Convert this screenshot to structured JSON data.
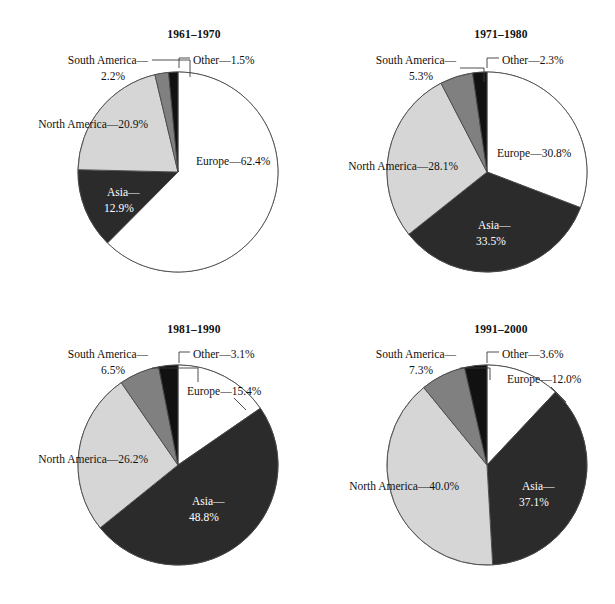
{
  "figure": {
    "background": "#ffffff",
    "width": 615,
    "height": 604
  },
  "palette": {
    "europe": "#ffffff",
    "asia": "#2b2b2b",
    "north_america": "#d6d6d6",
    "south_america": "#808080",
    "other": "#111111",
    "outline": "#4a4a4a",
    "text": "#111111",
    "text_on_dark": "#ffffff"
  },
  "chart_data": [
    {
      "type": "pie",
      "title": "1961–1970",
      "categories": [
        "Europe",
        "Asia",
        "North America",
        "South America",
        "Other"
      ],
      "values": [
        62.4,
        12.9,
        20.9,
        2.2,
        1.5
      ],
      "labels": [
        "Europe—62.4%",
        "Asia—",
        "12.9%",
        "North America—20.9%",
        "South America—",
        "2.2%",
        "Other—1.5%"
      ],
      "units": "percent",
      "start_angle_deg": 0,
      "direction": "clockwise"
    },
    {
      "type": "pie",
      "title": "1971–1980",
      "categories": [
        "Europe",
        "Asia",
        "North America",
        "South America",
        "Other"
      ],
      "values": [
        30.8,
        33.5,
        28.1,
        5.3,
        2.3
      ],
      "labels": [
        "Europe—30.8%",
        "Asia—",
        "33.5%",
        "North America—28.1%",
        "South America—",
        "5.3%",
        "Other—2.3%"
      ],
      "units": "percent",
      "start_angle_deg": 0,
      "direction": "clockwise"
    },
    {
      "type": "pie",
      "title": "1981–1990",
      "categories": [
        "Europe",
        "Asia",
        "North America",
        "South America",
        "Other"
      ],
      "values": [
        15.4,
        48.8,
        26.2,
        6.5,
        3.1
      ],
      "labels": [
        "Europe—15.4%",
        "Asia—",
        "48.8%",
        "North America—26.2%",
        "South America—",
        "6.5%",
        "Other—3.1%"
      ],
      "units": "percent",
      "start_angle_deg": 0,
      "direction": "clockwise"
    },
    {
      "type": "pie",
      "title": "1991–2000",
      "categories": [
        "Europe",
        "Asia",
        "North America",
        "South America",
        "Other"
      ],
      "values": [
        12.0,
        37.1,
        40.0,
        7.3,
        3.6
      ],
      "labels": [
        "Europe—12.0%",
        "Asia—",
        "37.1%",
        "North America—40.0%",
        "South America—",
        "7.3%",
        "Other—3.6%"
      ],
      "units": "percent",
      "start_angle_deg": 0,
      "direction": "clockwise"
    }
  ],
  "panels": [
    {
      "id": "p1",
      "title": "1961–1970",
      "cx": 178,
      "cy": 172,
      "r": 100,
      "title_x": 194,
      "title_y": 38,
      "texts": [
        {
          "name": "europe-label",
          "text": "Europe—62.4%",
          "x": 196,
          "y": 165,
          "anchor": "start",
          "dark": false
        },
        {
          "name": "asia-label-line1",
          "text": "Asia—",
          "x": 107,
          "y": 196,
          "anchor": "start",
          "dark": true
        },
        {
          "name": "asia-label-line2",
          "text": "12.9%",
          "x": 104,
          "y": 212,
          "anchor": "start",
          "dark": true
        },
        {
          "name": "north-america-label",
          "text": "North America—20.9%",
          "x": 148,
          "y": 128,
          "anchor": "end",
          "dark": false
        },
        {
          "name": "south-america-label-line1",
          "text": "South America—",
          "x": 148,
          "y": 64,
          "anchor": "end",
          "dark": false
        },
        {
          "name": "south-america-label-line2",
          "text": "2.2%",
          "x": 113,
          "y": 80,
          "anchor": "middle",
          "dark": false
        },
        {
          "name": "other-label",
          "text": "Other—1.5%",
          "x": 193,
          "y": 64,
          "anchor": "start",
          "dark": false
        }
      ]
    },
    {
      "id": "p2",
      "title": "1971–1980",
      "cx": 487,
      "cy": 172,
      "r": 100,
      "title_x": 501,
      "title_y": 38,
      "texts": [
        {
          "name": "europe-label",
          "text": "Europe—30.8%",
          "x": 497,
          "y": 157,
          "anchor": "start",
          "dark": false
        },
        {
          "name": "asia-label-line1",
          "text": "Asia—",
          "x": 478,
          "y": 229,
          "anchor": "start",
          "dark": true
        },
        {
          "name": "asia-label-line2",
          "text": "33.5%",
          "x": 476,
          "y": 245,
          "anchor": "start",
          "dark": true
        },
        {
          "name": "north-america-label",
          "text": "North America—28.1%",
          "x": 458,
          "y": 170,
          "anchor": "end",
          "dark": false
        },
        {
          "name": "south-america-label-line1",
          "text": "South America—",
          "x": 456,
          "y": 64,
          "anchor": "end",
          "dark": false
        },
        {
          "name": "south-america-label-line2",
          "text": "5.3%",
          "x": 421,
          "y": 80,
          "anchor": "middle",
          "dark": false
        },
        {
          "name": "other-label",
          "text": "Other—2.3%",
          "x": 502,
          "y": 64,
          "anchor": "start",
          "dark": false
        }
      ]
    },
    {
      "id": "p3",
      "title": "1981–1990",
      "cx": 178,
      "cy": 465,
      "r": 100,
      "title_x": 194,
      "title_y": 333,
      "texts": [
        {
          "name": "europe-label",
          "text": "Europe—15.4%",
          "x": 187,
          "y": 395,
          "anchor": "start",
          "dark": false
        },
        {
          "name": "asia-label-line1",
          "text": "Asia—",
          "x": 192,
          "y": 505,
          "anchor": "start",
          "dark": true
        },
        {
          "name": "asia-label-line2",
          "text": "48.8%",
          "x": 189,
          "y": 521,
          "anchor": "start",
          "dark": true
        },
        {
          "name": "north-america-label",
          "text": "North America—26.2%",
          "x": 148,
          "y": 463,
          "anchor": "end",
          "dark": false
        },
        {
          "name": "south-america-label-line1",
          "text": "South America—",
          "x": 148,
          "y": 358,
          "anchor": "end",
          "dark": false
        },
        {
          "name": "south-america-label-line2",
          "text": "6.5%",
          "x": 113,
          "y": 374,
          "anchor": "middle",
          "dark": false
        },
        {
          "name": "other-label",
          "text": "Other—3.1%",
          "x": 193,
          "y": 358,
          "anchor": "start",
          "dark": false
        }
      ]
    },
    {
      "id": "p4",
      "title": "1991–2000",
      "cx": 487,
      "cy": 465,
      "r": 100,
      "title_x": 501,
      "title_y": 333,
      "texts": [
        {
          "name": "europe-label",
          "text": "Europe—12.0%",
          "x": 507,
          "y": 383,
          "anchor": "start",
          "dark": false
        },
        {
          "name": "asia-label-line1",
          "text": "Asia—",
          "x": 522,
          "y": 490,
          "anchor": "start",
          "dark": true
        },
        {
          "name": "asia-label-line2",
          "text": "37.1%",
          "x": 519,
          "y": 506,
          "anchor": "start",
          "dark": true
        },
        {
          "name": "north-america-label",
          "text": "North America—40.0%",
          "x": 459,
          "y": 490,
          "anchor": "end",
          "dark": false
        },
        {
          "name": "south-america-label-line1",
          "text": "South America—",
          "x": 456,
          "y": 358,
          "anchor": "end",
          "dark": false
        },
        {
          "name": "south-america-label-line2",
          "text": "7.3%",
          "x": 421,
          "y": 374,
          "anchor": "middle",
          "dark": false
        },
        {
          "name": "other-label",
          "text": "Other—3.6%",
          "x": 502,
          "y": 358,
          "anchor": "start",
          "dark": false
        }
      ]
    }
  ],
  "callouts": [
    {
      "panel": "p1",
      "name": "south-america-callout",
      "points": "152,60 190,60 190,77"
    },
    {
      "panel": "p1",
      "name": "other-callout",
      "points": "179,68 179,58 190,58"
    },
    {
      "panel": "p2",
      "name": "south-america-callout",
      "points": "460,68 484,68 484,82"
    },
    {
      "panel": "p2",
      "name": "other-callout",
      "points": "487,68 487,58 499,58"
    },
    {
      "panel": "p3",
      "name": "south-america-callout",
      "points": "152,368 198,368 198,382"
    },
    {
      "panel": "p3",
      "name": "other-callout",
      "points": "179,363 179,352 190,352"
    },
    {
      "panel": "p4",
      "name": "south-america-callout",
      "points": "460,368 490,368 490,380"
    },
    {
      "panel": "p4",
      "name": "other-callout",
      "points": "487,363 487,352 499,352"
    },
    {
      "panel": "p3",
      "name": "europe-callout",
      "points": "234,398 246,410"
    },
    {
      "panel": "p4",
      "name": "europe-callout",
      "points": "551,387 566,402"
    }
  ]
}
